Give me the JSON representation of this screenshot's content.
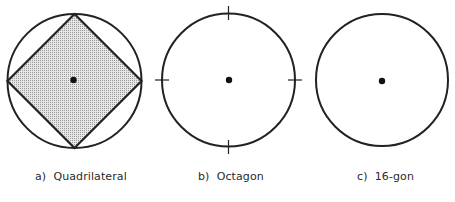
{
  "figure": {
    "panels": [
      {
        "id": "a",
        "caption": "a)  Quadrilateral",
        "shape": "circle with inscribed square (diamond), shaded interior",
        "circle": {
          "cx": 74.5,
          "cy": 81,
          "r": 67
        },
        "polygon_sides": 4,
        "center_dot": true,
        "shaded": true
      },
      {
        "id": "b",
        "caption": "b)  Octagon",
        "shape": "circle with four tick marks at top, bottom, left, right",
        "circle": {
          "cx": 228.5,
          "cy": 80,
          "r": 66.5
        },
        "tick_marks": 4,
        "center_dot": true
      },
      {
        "id": "c",
        "caption": "c)  16-gon",
        "shape": "circle only",
        "circle": {
          "cx": 382,
          "cy": 80,
          "r": 66
        },
        "center_dot": true
      }
    ],
    "colors": {
      "stroke": "#222222",
      "fill_shading": "#d6d6d6",
      "background": "#ffffff"
    }
  }
}
